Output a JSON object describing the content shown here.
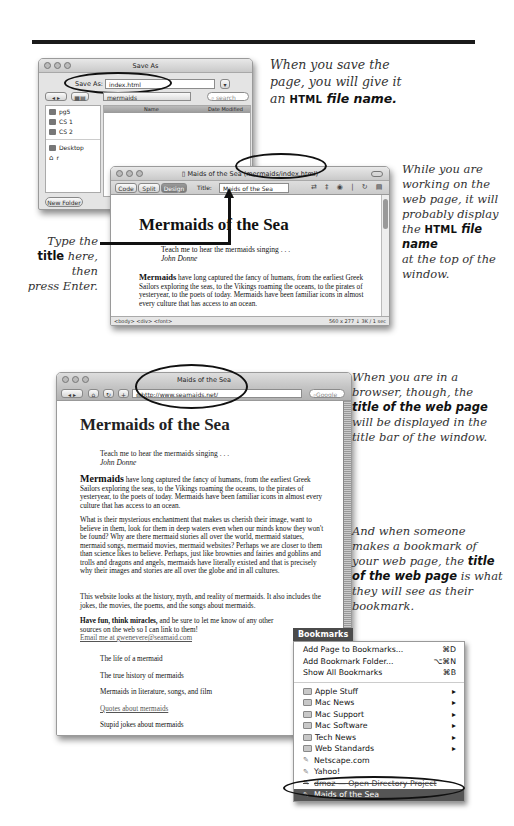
{
  "captions": {
    "save": [
      "When you save the",
      "page, you will give it",
      "an ",
      "HTML",
      " file name."
    ],
    "working": [
      "While you are",
      "working on the",
      "web page, it will",
      "probably display",
      "the ",
      "HTML",
      " file name",
      "at the top of the",
      "window."
    ],
    "type_title": [
      "Type the",
      "title",
      " here, then",
      "press Enter."
    ],
    "browser": [
      "When you are in a",
      "browser, though, the",
      "title of the web page",
      "will be displayed in the",
      "title bar of the window."
    ],
    "bookmark": [
      "And when someone",
      "makes a bookmark of",
      "your web page, the ",
      "title",
      "of the web page",
      " is what",
      "they will see as their",
      "bookmark."
    ]
  },
  "save_dialog": {
    "title": "Save As",
    "save_as_label": "Save As:",
    "filename_value": "index.html",
    "folder_popup": "mermaids",
    "search_placeholder": "search",
    "sidebar": [
      "pg5",
      "CS 1",
      "CS 2",
      "Desktop",
      "r"
    ],
    "columns": [
      "Name",
      "Date Modified"
    ],
    "new_folder_button": "New Folder"
  },
  "dw_window": {
    "title_main": "Maids of the Sea",
    "title_path": "(mermaids/index.html)",
    "views": [
      "Code",
      "Split",
      "Design"
    ],
    "title_label": "Title:",
    "title_value": "Maids of the Sea",
    "status_tags": "<body> <div> <font>",
    "status_size": "560 x 277 ↓ 3K / 1 sec"
  },
  "page": {
    "heading": "Mermaids of the Sea",
    "quote": "Teach me to hear the mermaids singing . . .",
    "quote_author": "John Donne",
    "para1_bold": "Mermaids",
    "para1": " have long captured the fancy of humans, from the earliest Greek Sailors exploring the seas, to the Vikings roaming the oceans, to the pirates of yesteryear, to the poets of today. Mermaids have been familiar icons in almost every culture that has access to an ocean.",
    "para2": "What is their mysterious enchantment that makes us cherish their image, want to believe in them, look for them in deep waters even when our minds know they won't be found? Why are there mermaid stories all over the world, mermaid statues, mermaid songs, mermaid movies, mermaid websites? Perhaps we are closer to them than science likes to believe. Perhaps, just like brownies and fairies and goblins and trolls and dragons and angels, mermaids have literally existed and that is precisely why their images and stories are all over the globe and in all cultures.",
    "para3": "This website looks at the history, myth, and reality of mermaids. It also includes the jokes, the movies, the poems, and the songs about mermaids.",
    "para4_bold": "Have fun, think miracles,",
    "para4": " and be sure to let me know of any other sources on the web so I can link to them!",
    "email_link": "Email me at gwenevere@seamaid.com",
    "links": [
      "The life of a mermaid",
      "The true history of mermaids",
      "Mermaids in literature, songs, and film",
      "Quotes about mermaids",
      "Stupid jokes about mermaids"
    ]
  },
  "browser": {
    "title": "Maids of the Sea",
    "url": "http://www.seamaids.net/",
    "search_placeholder": "Google"
  },
  "bookmarks_menu": {
    "title": "Bookmarks",
    "commands": [
      {
        "label": "Add Page to Bookmarks...",
        "shortcut": "⌘D"
      },
      {
        "label": "Add Bookmark Folder...",
        "shortcut": "⌥⌘N"
      },
      {
        "label": "Show All Bookmarks",
        "shortcut": "⌘B"
      }
    ],
    "folders": [
      "Apple Stuff",
      "Mac News",
      "Mac Support",
      "Mac Software",
      "Tech News",
      "Web Standards"
    ],
    "bookmarks": [
      "Netscape.com",
      "Yahoo!",
      "dmoz — Open Directory Project",
      "Maids of the Sea"
    ]
  }
}
